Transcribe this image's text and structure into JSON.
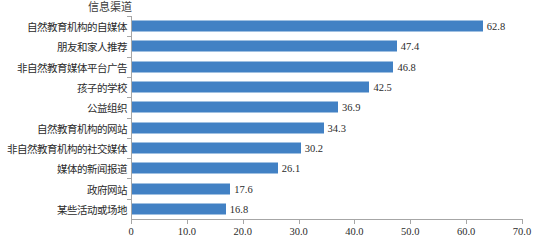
{
  "chart_data": {
    "type": "bar",
    "orientation": "horizontal",
    "title": "信息渠道",
    "xlabel": "",
    "ylabel": "",
    "xlim": [
      0,
      70
    ],
    "xticks": [
      "0",
      "10.0",
      "20.0",
      "30.0",
      "40.0",
      "50.0",
      "60.0",
      "70.0"
    ],
    "xtick_values": [
      0,
      10,
      20,
      30,
      40,
      50,
      60,
      70
    ],
    "grid": false,
    "legend": "none",
    "bar_color": "#4281c4",
    "axis_color": "#a6a6a6",
    "text_color": "#2b2b2b",
    "categories": [
      "自然教育机构的自媒体",
      "朋友和家人推荐",
      "非自然教育媒体平台广告",
      "孩子的学校",
      "公益组织",
      "自然教育机构的网站",
      "非自然教育机构的社交媒体",
      "媒体的新闻报道",
      "政府网站",
      "某些活动或场地"
    ],
    "values": [
      62.8,
      47.4,
      46.8,
      42.5,
      36.9,
      34.3,
      30.2,
      26.1,
      17.6,
      16.8
    ],
    "value_labels": [
      "62.8",
      "47.4",
      "46.8",
      "42.5",
      "36.9",
      "34.3",
      "30.2",
      "26.1",
      "17.6",
      "16.8"
    ]
  }
}
